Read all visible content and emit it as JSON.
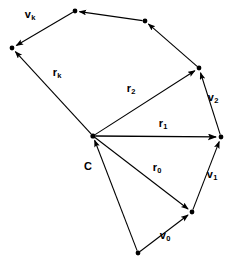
{
  "figure": {
    "background_color": "#ffffff",
    "stroke_color": "#000000",
    "width": 233,
    "height": 264
  },
  "points": {
    "center": {
      "name": "C",
      "x": 93,
      "y": 136
    },
    "p0": {
      "name": "P0",
      "x": 138,
      "y": 253
    },
    "p1": {
      "name": "P1",
      "x": 192,
      "y": 212
    },
    "p2": {
      "name": "P2",
      "x": 221,
      "y": 137
    },
    "p3": {
      "name": "P3",
      "x": 199,
      "y": 68
    },
    "p4": {
      "name": "P4",
      "x": 145,
      "y": 21
    },
    "p5": {
      "name": "P5",
      "x": 75,
      "y": 11
    },
    "p6": {
      "name": "Pk",
      "x": 12,
      "y": 48
    }
  },
  "radius_vectors": [
    {
      "id": "r0",
      "base": "r",
      "sub": "0",
      "from_x": 93,
      "from_y": 136,
      "to_x": 192,
      "to_y": 212,
      "label_x": 157,
      "label_y": 167
    },
    {
      "id": "r1",
      "base": "r",
      "sub": "1",
      "from_x": 93,
      "from_y": 136,
      "to_x": 221,
      "to_y": 137,
      "label_x": 163,
      "label_y": 123
    },
    {
      "id": "r2",
      "base": "r",
      "sub": "2",
      "from_x": 93,
      "from_y": 136,
      "to_x": 199,
      "to_y": 68,
      "label_x": 131,
      "label_y": 88
    },
    {
      "id": "rk",
      "base": "r",
      "sub": "k",
      "from_x": 93,
      "from_y": 136,
      "to_x": 12,
      "to_y": 48,
      "label_x": 57,
      "label_y": 72
    }
  ],
  "velocity_vectors": [
    {
      "id": "v0",
      "base": "v",
      "sub": "0",
      "from_x": 138,
      "from_y": 253,
      "to_x": 192,
      "to_y": 212,
      "label_x": 165,
      "label_y": 235
    },
    {
      "id": "v1",
      "base": "v",
      "sub": "1",
      "from_x": 192,
      "from_y": 212,
      "to_x": 221,
      "to_y": 137,
      "label_x": 212,
      "label_y": 174
    },
    {
      "id": "v2",
      "base": "v",
      "sub": "2",
      "from_x": 221,
      "from_y": 137,
      "to_x": 199,
      "to_y": 68,
      "label_x": 213,
      "label_y": 97
    },
    {
      "id": "vk",
      "base": "v",
      "sub": "k",
      "from_x": 75,
      "from_y": 11,
      "to_x": 12,
      "to_y": 48,
      "label_x": 30,
      "label_y": 14
    }
  ],
  "plain_edges": [
    {
      "id": "edge-p3-p4",
      "from_x": 199,
      "from_y": 68,
      "to_x": 145,
      "to_y": 21
    },
    {
      "id": "edge-p4-p5",
      "from_x": 145,
      "from_y": 21,
      "to_x": 75,
      "to_y": 11
    },
    {
      "id": "edge-p0-center",
      "from_x": 138,
      "from_y": 253,
      "to_x": 93,
      "to_y": 136
    }
  ],
  "center_label": {
    "text": "C",
    "x": 88,
    "y": 166
  }
}
